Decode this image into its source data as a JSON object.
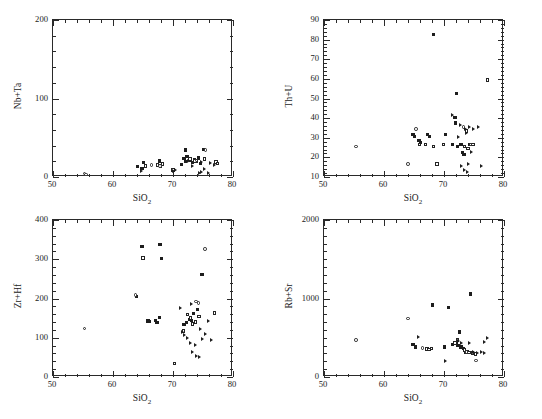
{
  "figure": {
    "header_text": "",
    "caption_text": "",
    "axis_x_label": "SiO2",
    "x_label_html": "SiO<sub>2</sub>"
  },
  "chart_data": [
    {
      "type": "scatter",
      "panel": "top-left",
      "title": "",
      "xlabel": "SiO2",
      "ylabel": "Nb+Ta",
      "xlim": [
        50,
        80
      ],
      "ylim": [
        0,
        200
      ],
      "xticks": [
        50,
        60,
        70,
        80
      ],
      "yticks": [
        0,
        100,
        200
      ],
      "x_minor_interval": 2,
      "y_minor_interval": 20,
      "grid": false,
      "legend": "none",
      "series": [
        {
          "name": "filled-square",
          "marker": "sq-f",
          "points": [
            [
              64.3,
              12
            ],
            [
              65.2,
              17
            ],
            [
              65.0,
              10
            ],
            [
              67.9,
              19
            ],
            [
              71.6,
              15
            ],
            [
              72.0,
              22
            ],
            [
              72.3,
              18
            ],
            [
              72.5,
              25
            ],
            [
              73.1,
              20
            ],
            [
              73.4,
              17
            ],
            [
              73.7,
              21
            ],
            [
              74.0,
              19
            ],
            [
              74.4,
              23
            ],
            [
              74.8,
              16
            ],
            [
              75.2,
              34
            ],
            [
              72.2,
              33
            ]
          ]
        },
        {
          "name": "open-square",
          "marker": "sq-o",
          "points": [
            [
              67.6,
              14
            ],
            [
              68.1,
              13
            ],
            [
              68.4,
              15
            ],
            [
              70.2,
              8
            ],
            [
              73.0,
              22
            ],
            [
              73.8,
              19
            ],
            [
              75.4,
              22
            ],
            [
              77.3,
              18
            ],
            [
              77.6,
              16
            ],
            [
              65.6,
              13
            ]
          ]
        },
        {
          "name": "open-circle",
          "marker": "ci-o",
          "points": [
            [
              55.4,
              3
            ],
            [
              55.7,
              2
            ],
            [
              66.6,
              14
            ],
            [
              68.0,
              13
            ],
            [
              75.6,
              33
            ],
            [
              74.1,
              20
            ]
          ]
        },
        {
          "name": "triangle-right",
          "marker": "tri",
          "points": [
            [
              64.9,
              6
            ],
            [
              70.3,
              6
            ],
            [
              70.6,
              8
            ],
            [
              73.5,
              12
            ],
            [
              74.6,
              4
            ],
            [
              75.0,
              5
            ],
            [
              75.4,
              9
            ],
            [
              76.1,
              4
            ],
            [
              76.4,
              17
            ],
            [
              77.1,
              14
            ],
            [
              72.8,
              19
            ],
            [
              74.9,
              18
            ]
          ]
        }
      ]
    },
    {
      "type": "scatter",
      "panel": "top-right",
      "title": "",
      "xlabel": "SiO2",
      "ylabel": "Th+U",
      "xlim": [
        50,
        80
      ],
      "ylim": [
        10,
        90
      ],
      "xticks": [
        50,
        60,
        70,
        80
      ],
      "yticks": [
        10,
        20,
        30,
        40,
        50,
        60,
        70,
        80,
        90
      ],
      "x_minor_interval": 2,
      "y_minor_interval": 2,
      "grid": false,
      "legend": "none",
      "series": [
        {
          "name": "filled-square",
          "marker": "sq-f",
          "points": [
            [
              65.0,
              31
            ],
            [
              65.3,
              30
            ],
            [
              66.0,
              28
            ],
            [
              66.3,
              27
            ],
            [
              67.4,
              31
            ],
            [
              67.7,
              30
            ],
            [
              68.4,
              82
            ],
            [
              70.4,
              31
            ],
            [
              71.6,
              26
            ],
            [
              72.0,
              40
            ],
            [
              72.1,
              37
            ],
            [
              72.4,
              25
            ],
            [
              73.0,
              26
            ],
            [
              73.3,
              22
            ],
            [
              73.5,
              21
            ],
            [
              74.5,
              26
            ],
            [
              72.3,
              52
            ]
          ]
        },
        {
          "name": "open-square",
          "marker": "sq-o",
          "points": [
            [
              66.1,
              26
            ],
            [
              67.1,
              26
            ],
            [
              68.4,
              25
            ],
            [
              70.1,
              26
            ],
            [
              73.6,
              25
            ],
            [
              74.2,
              24
            ],
            [
              75.0,
              26
            ],
            [
              77.4,
              59
            ],
            [
              69.0,
              16
            ],
            [
              73.9,
              33
            ]
          ]
        },
        {
          "name": "open-circle",
          "marker": "ci-o",
          "points": [
            [
              55.5,
              25
            ],
            [
              64.2,
              16
            ],
            [
              65.5,
              34
            ],
            [
              73.4,
              35
            ],
            [
              74.6,
              26
            ]
          ]
        },
        {
          "name": "triangle-right",
          "marker": "tri",
          "points": [
            [
              71.7,
              41
            ],
            [
              72.9,
              36
            ],
            [
              73.8,
              34
            ],
            [
              74.0,
              32
            ],
            [
              74.4,
              35
            ],
            [
              74.8,
              22
            ],
            [
              75.2,
              34
            ],
            [
              75.9,
              35
            ],
            [
              73.1,
              15
            ],
            [
              73.6,
              13
            ],
            [
              74.1,
              12
            ],
            [
              74.3,
              16
            ],
            [
              76.5,
              15
            ],
            [
              72.6,
              30
            ]
          ]
        }
      ]
    },
    {
      "type": "scatter",
      "panel": "bottom-left",
      "title": "",
      "xlabel": "SiO2",
      "ylabel": "Zr+Hf",
      "xlim": [
        50,
        80
      ],
      "ylim": [
        0,
        400
      ],
      "xticks": [
        50,
        60,
        70,
        80
      ],
      "yticks": [
        0,
        100,
        200,
        300,
        400
      ],
      "x_minor_interval": 2,
      "y_minor_interval": 20,
      "grid": false,
      "legend": "none",
      "series": [
        {
          "name": "filled-square",
          "marker": "sq-f",
          "points": [
            [
              65.0,
              329
            ],
            [
              66.0,
              140
            ],
            [
              66.3,
              138
            ],
            [
              67.2,
              141
            ],
            [
              67.5,
              137
            ],
            [
              67.9,
              148
            ],
            [
              68.0,
              334
            ],
            [
              68.3,
              299
            ],
            [
              72.0,
              131
            ],
            [
              72.4,
              137
            ],
            [
              73.0,
              144
            ],
            [
              73.3,
              142
            ],
            [
              73.6,
              160
            ],
            [
              74.2,
              170
            ],
            [
              75.0,
              259
            ],
            [
              64.1,
              202
            ]
          ]
        },
        {
          "name": "open-square",
          "marker": "sq-o",
          "points": [
            [
              65.2,
              301
            ],
            [
              70.4,
              32
            ],
            [
              72.6,
              157
            ],
            [
              73.4,
              133
            ],
            [
              73.9,
              138
            ],
            [
              74.5,
              152
            ],
            [
              77.1,
              160
            ],
            [
              73.1,
              148
            ],
            [
              71.9,
              115
            ]
          ]
        },
        {
          "name": "open-circle",
          "marker": "ci-o",
          "points": [
            [
              55.4,
              121
            ],
            [
              63.9,
              207
            ],
            [
              74.0,
              190
            ],
            [
              74.4,
              186
            ],
            [
              75.5,
              324
            ]
          ]
        },
        {
          "name": "triangle-right",
          "marker": "tri",
          "points": [
            [
              71.4,
              173
            ],
            [
              71.8,
              111
            ],
            [
              72.2,
              104
            ],
            [
              72.6,
              97
            ],
            [
              73.2,
              85
            ],
            [
              73.5,
              61
            ],
            [
              74.0,
              80
            ],
            [
              74.2,
              50
            ],
            [
              74.6,
              48
            ],
            [
              75.1,
              95
            ],
            [
              75.6,
              108
            ],
            [
              76.2,
              141
            ],
            [
              76.7,
              92
            ],
            [
              73.3,
              184
            ],
            [
              74.8,
              120
            ]
          ]
        }
      ]
    },
    {
      "type": "scatter",
      "panel": "bottom-right",
      "title": "",
      "xlabel": "SiO2",
      "ylabel": "Rb+Sr",
      "xlim": [
        50,
        80
      ],
      "ylim": [
        0,
        2000
      ],
      "xticks": [
        50,
        60,
        70,
        80
      ],
      "yticks": [
        0,
        1000,
        2000
      ],
      "x_minor_interval": 2,
      "y_minor_interval": 100,
      "grid": false,
      "legend": "none",
      "series": [
        {
          "name": "filled-square",
          "marker": "sq-f",
          "points": [
            [
              65.0,
              400
            ],
            [
              65.4,
              370
            ],
            [
              68.3,
              905
            ],
            [
              70.9,
              875
            ],
            [
              71.6,
              400
            ],
            [
              71.9,
              420
            ],
            [
              72.2,
              430
            ],
            [
              72.5,
              385
            ],
            [
              73.0,
              370
            ],
            [
              73.4,
              350
            ],
            [
              73.8,
              300
            ],
            [
              74.1,
              310
            ],
            [
              74.6,
              1045
            ],
            [
              72.8,
              560
            ],
            [
              70.3,
              370
            ]
          ]
        },
        {
          "name": "open-square",
          "marker": "sq-o",
          "points": [
            [
              67.3,
              345
            ],
            [
              67.7,
              340
            ],
            [
              68.1,
              348
            ],
            [
              72.0,
              420
            ],
            [
              73.6,
              330
            ],
            [
              74.3,
              300
            ],
            [
              74.9,
              290
            ],
            [
              75.4,
              280
            ],
            [
              72.4,
              455
            ]
          ]
        },
        {
          "name": "open-circle",
          "marker": "ci-o",
          "points": [
            [
              55.5,
              455
            ],
            [
              64.2,
              730
            ],
            [
              66.6,
              355
            ],
            [
              75.5,
              195
            ],
            [
              73.9,
              305
            ]
          ]
        },
        {
          "name": "triangle-right",
          "marker": "tri",
          "points": [
            [
              65.9,
              490
            ],
            [
              70.5,
              195
            ],
            [
              72.7,
              440
            ],
            [
              73.2,
              415
            ],
            [
              74.4,
              425
            ],
            [
              75.1,
              300
            ],
            [
              75.8,
              290
            ],
            [
              76.4,
              300
            ],
            [
              77.0,
              290
            ],
            [
              77.4,
              480
            ],
            [
              76.9,
              435
            ],
            [
              73.5,
              360
            ]
          ]
        }
      ]
    }
  ]
}
